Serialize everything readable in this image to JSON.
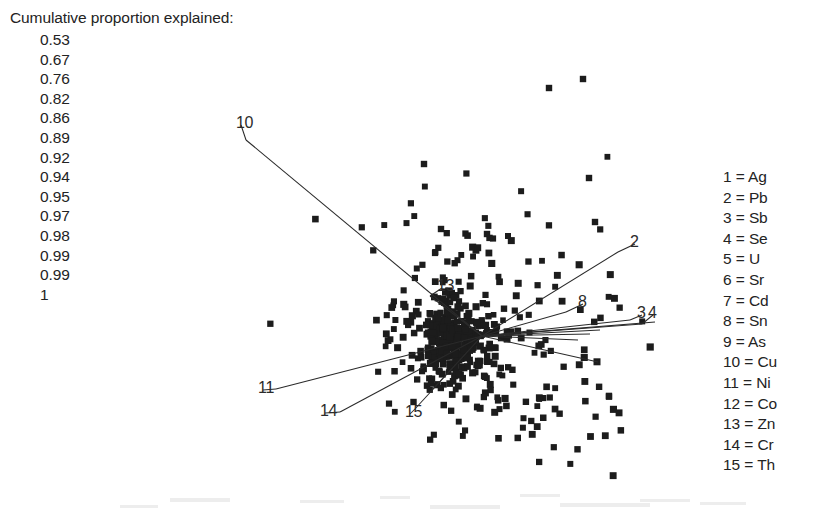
{
  "cumulative": {
    "title": "Cumulative proportion explained:",
    "values": [
      "0.53",
      "0.67",
      "0.76",
      "0.82",
      "0.86",
      "0.89",
      "0.92",
      "0.94",
      "0.95",
      "0.97",
      "0.98",
      "0.99",
      "0.99",
      "1"
    ]
  },
  "legend": {
    "entries": [
      "1 = Ag",
      "2 = Pb",
      "3 = Sb",
      "4 = Se",
      "5 = U",
      "6 = Sr",
      "7 = Cd",
      "8 = Sn",
      "9 = As",
      "10 = Cu",
      "11 = Ni",
      "12 = Co",
      "13 = Zn",
      "14 = Cr",
      "15 = Th"
    ]
  },
  "chart_data": {
    "type": "scatter",
    "title": "",
    "subtitle": "",
    "xlabel": "",
    "ylabel": "",
    "grid": false,
    "legend_position": "right",
    "axis_ranges": {
      "x": [
        150,
        700
      ],
      "y": [
        60,
        480
      ]
    },
    "origin_px": [
      482,
      336
    ],
    "variable_vectors": [
      {
        "id": "1",
        "element": "Ag",
        "label_px": [
          null,
          null
        ],
        "tip_px": [
          655,
          322
        ],
        "visible_label": false
      },
      {
        "id": "2",
        "element": "Pb",
        "label_px": [
          630,
          247
        ],
        "tip_px": [
          618,
          252
        ],
        "visible_label": true
      },
      {
        "id": "3",
        "element": "Sb",
        "label_px": [
          637,
          318
        ],
        "tip_px": [
          630,
          320
        ],
        "visible_label": true
      },
      {
        "id": "4",
        "element": "Se",
        "label_px": [
          648,
          318
        ],
        "tip_px": [
          642,
          324
        ],
        "visible_label": true
      },
      {
        "id": "5",
        "element": "U",
        "label_px": [
          null,
          null
        ],
        "tip_px": [
          600,
          330
        ],
        "visible_label": false
      },
      {
        "id": "6",
        "element": "Sr",
        "label_px": [
          null,
          null
        ],
        "tip_px": [
          590,
          334
        ],
        "visible_label": false
      },
      {
        "id": "7",
        "element": "Cd",
        "label_px": [
          null,
          null
        ],
        "tip_px": [
          578,
          340
        ],
        "visible_label": false
      },
      {
        "id": "8",
        "element": "Sn",
        "label_px": [
          578,
          307
        ],
        "tip_px": [
          566,
          312
        ],
        "visible_label": true
      },
      {
        "id": "9",
        "element": "As",
        "label_px": [
          null,
          null
        ],
        "tip_px": [
          598,
          362
        ],
        "visible_label": false
      },
      {
        "id": "10",
        "element": "Cu",
        "label_px": [
          236,
          128
        ],
        "tip_px": [
          246,
          140
        ],
        "visible_label": true
      },
      {
        "id": "11",
        "element": "Ni",
        "label_px": [
          258,
          393
        ],
        "tip_px": [
          276,
          389
        ],
        "visible_label": true
      },
      {
        "id": "12",
        "element": "Co",
        "label_px": [
          null,
          null
        ],
        "tip_px": [
          430,
          392
        ],
        "visible_label": false
      },
      {
        "id": "13",
        "element": "Zn",
        "label_px": [
          437,
          291
        ],
        "tip_px": [
          430,
          296
        ],
        "visible_label": true
      },
      {
        "id": "14",
        "element": "Cr",
        "label_px": [
          320,
          416
        ],
        "tip_px": [
          340,
          412
        ],
        "visible_label": true
      },
      {
        "id": "15",
        "element": "Th",
        "label_px": [
          405,
          417
        ],
        "tip_px": [
          414,
          410
        ],
        "visible_label": true
      }
    ],
    "n_points_approx": 470,
    "point_marker": "filled-square",
    "point_size_px": 6,
    "cluster_center_px": [
      470,
      340
    ],
    "outlier_points_px": [
      [
        549,
        88
      ],
      [
        583,
        79
      ],
      [
        424,
        164
      ],
      [
        589,
        178
      ],
      [
        595,
        222
      ],
      [
        441,
        229
      ],
      [
        487,
        234
      ]
    ]
  }
}
